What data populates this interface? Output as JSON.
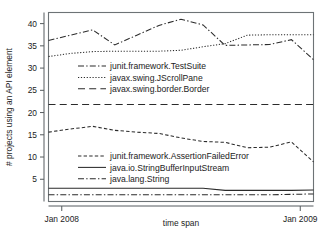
{
  "chart_data": {
    "type": "line",
    "title": "",
    "xlabel": "time span",
    "ylabel": "# projects using an API element",
    "xlim": [
      0,
      12
    ],
    "ylim": [
      0,
      42.5
    ],
    "grid": false,
    "legend_position": "inside-left",
    "xtick_labels": [
      "Jan 2008",
      "Jan 2009"
    ],
    "xtick_values": [
      0.6,
      11.4
    ],
    "ytick_labels": [
      "5",
      "10",
      "15",
      "20",
      "25",
      "30",
      "35",
      "40"
    ],
    "ytick_values": [
      5,
      10,
      15,
      20,
      25,
      30,
      35,
      40
    ],
    "x": [
      0,
      1,
      2,
      3,
      4,
      5,
      6,
      7,
      8,
      9,
      10,
      11,
      12
    ],
    "series": [
      {
        "name": "junit.framework.TestSuite",
        "style": "dashdot",
        "values": [
          36.2,
          37.4,
          38.6,
          35.2,
          37.4,
          39.6,
          41.0,
          39.7,
          35.1,
          35.2,
          35.3,
          36.4,
          31.9
        ]
      },
      {
        "name": "javax.swing.JScrollPane",
        "style": "dotted",
        "values": [
          32.6,
          33.3,
          33.7,
          33.8,
          33.8,
          33.8,
          34.0,
          34.8,
          35.5,
          37.4,
          37.5,
          37.5,
          37.5
        ]
      },
      {
        "name": "javax.swing.border.Border",
        "style": "longdash",
        "values": [
          21.8,
          21.8,
          21.8,
          21.8,
          21.8,
          21.8,
          21.8,
          21.8,
          21.8,
          21.8,
          21.8,
          21.8,
          21.8
        ]
      },
      {
        "name": "junit.framework.AssertionFailedError",
        "style": "dashed",
        "values": [
          15.6,
          16.3,
          16.9,
          16.0,
          15.6,
          15.3,
          14.3,
          13.5,
          13.3,
          12.1,
          12.2,
          13.4,
          8.9
        ]
      },
      {
        "name": "java.io.StringBufferInputStream",
        "style": "solid",
        "values": [
          3.0,
          3.0,
          3.0,
          3.0,
          3.0,
          3.0,
          3.0,
          3.0,
          2.5,
          2.5,
          2.5,
          2.5,
          2.6
        ]
      },
      {
        "name": "java.lang.String",
        "style": "dashdot",
        "values": [
          1.5,
          1.5,
          1.5,
          1.5,
          1.5,
          1.5,
          1.5,
          1.5,
          1.5,
          1.5,
          1.5,
          1.6,
          1.7
        ]
      }
    ],
    "legend_groups": [
      {
        "entries": [
          {
            "label": "junit.framework.TestSuite",
            "style": "dashdot"
          },
          {
            "label": "javax.swing.JScrollPane",
            "style": "dotted"
          },
          {
            "label": "javax.swing.border.Border",
            "style": "longdash"
          }
        ]
      },
      {
        "entries": [
          {
            "label": "junit.framework.AssertionFailedError",
            "style": "dashed"
          },
          {
            "label": "java.io.StringBufferInputStream",
            "style": "solid"
          },
          {
            "label": "java.lang.String",
            "style": "dashdot"
          }
        ]
      }
    ],
    "colors": {
      "line": "#2b2b2b",
      "axis": "#555b5e",
      "frame": "#6d7376",
      "text": "#1b1b1b",
      "background": "#ffffff"
    }
  }
}
